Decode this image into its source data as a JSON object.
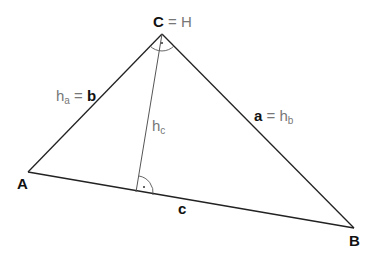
{
  "diagram": {
    "type": "right-triangle",
    "vertices": {
      "A": {
        "label": "A",
        "x": 28,
        "y": 172
      },
      "B": {
        "label": "B",
        "x": 354,
        "y": 228
      },
      "C": {
        "label": "C",
        "x": 162,
        "y": 34
      }
    },
    "altitude_foot": {
      "x": 136,
      "y": 192
    },
    "labels": {
      "vertex_c": "C",
      "vertex_c_eq": "= H",
      "vertex_a": "A",
      "vertex_b": "B",
      "side_b_prefix_h": "h",
      "side_b_prefix_sub": "a",
      "side_b_eq": "=",
      "side_b": "b",
      "side_a": "a",
      "side_a_eq": "=",
      "side_a_h": "h",
      "side_a_sub": "b",
      "altitude_h": "h",
      "altitude_sub": "c",
      "side_c": "c"
    },
    "colors": {
      "line": "#222222",
      "altitude": "#555555",
      "bold_text": "#111111",
      "gray_text": "#777777"
    }
  }
}
